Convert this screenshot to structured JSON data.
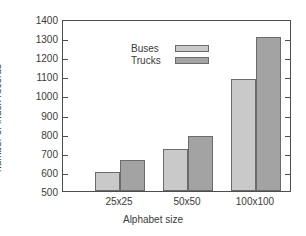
{
  "chart_data": {
    "type": "bar",
    "title": "",
    "xlabel": "Alphabet size",
    "ylabel": "number of index records",
    "categories": [
      "25x25",
      "50x50",
      "100x100"
    ],
    "series": [
      {
        "name": "Buses",
        "values": [
          600,
          718,
          1085
        ],
        "color": "#c9c9c9"
      },
      {
        "name": "Trucks",
        "values": [
          660,
          790,
          1305
        ],
        "color": "#a3a3a3"
      }
    ],
    "ylim": [
      500,
      1400
    ],
    "yticks": [
      500,
      600,
      700,
      800,
      900,
      1000,
      1100,
      1200,
      1300,
      1400
    ],
    "ytick_labels": [
      "500",
      "600",
      "700",
      "800",
      "900",
      "1000",
      "1100",
      "1200",
      "1300",
      "1400"
    ],
    "grid": false,
    "legend_position": "top-left",
    "frame": true
  },
  "legend": {
    "items": [
      {
        "label": "Buses"
      },
      {
        "label": "Trucks"
      }
    ]
  }
}
